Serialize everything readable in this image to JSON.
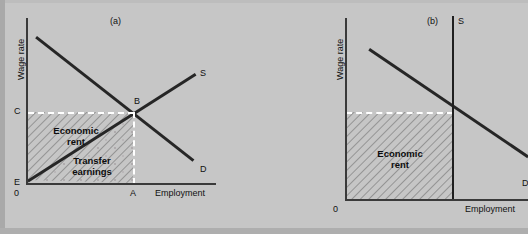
{
  "figure": {
    "title": "",
    "background_color": "#c6c6c6",
    "curve_color": "#262626",
    "axis_color": "#3a3a3a",
    "dashed_color": "#ffffff"
  },
  "panels": [
    {
      "key": "a",
      "caption": "(a)",
      "y_axis_label": "Wage rate",
      "x_axis_label": "Employment",
      "origin_label": "0",
      "curves": [
        {
          "name": "supply",
          "label": "S",
          "type": "upward-sloping"
        },
        {
          "name": "demand",
          "label": "D",
          "type": "downward-sloping"
        }
      ],
      "points": [
        {
          "label": "B",
          "meaning": "equilibrium"
        },
        {
          "label": "C",
          "meaning": "equilibrium-wage-on-y-axis"
        },
        {
          "label": "A",
          "meaning": "equilibrium-employment-on-x-axis"
        },
        {
          "label": "E",
          "meaning": "supply-curve-intercept"
        }
      ],
      "regions": [
        {
          "name": "economic-rent",
          "label": "Economic\nrent",
          "label_line1": "Economic",
          "label_line2": "rent",
          "fill": "hatched"
        },
        {
          "name": "transfer-earnings",
          "label_line1": "Transfer",
          "label_line2": "earnings",
          "fill": "stippled"
        }
      ]
    },
    {
      "key": "b",
      "caption": "(b)",
      "y_axis_label": "Wage rate",
      "x_axis_label": "Employment",
      "origin_label": "0",
      "curves": [
        {
          "name": "supply",
          "label": "S",
          "type": "perfectly-inelastic-vertical"
        },
        {
          "name": "demand",
          "label": "D",
          "type": "downward-sloping"
        }
      ],
      "points": [],
      "regions": [
        {
          "name": "economic-rent",
          "label_line1": "Economic",
          "label_line2": "rent",
          "fill": "hatched"
        }
      ]
    }
  ]
}
